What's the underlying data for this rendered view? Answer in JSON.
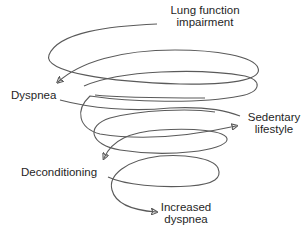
{
  "diagram": {
    "type": "downward-spiral",
    "stroke_color": "#5a5a5a",
    "text_color": "#1f1f1f",
    "background": "#ffffff",
    "nodes": [
      {
        "id": "lung",
        "line1": "Lung function",
        "line2": "impairment"
      },
      {
        "id": "dyspnea",
        "line1": "Dyspnea"
      },
      {
        "id": "sedentary",
        "line1": "Sedentary",
        "line2": "lifestyle"
      },
      {
        "id": "deconditioning",
        "line1": "Deconditioning"
      },
      {
        "id": "increased",
        "line1": "Increased",
        "line2": "dyspnea"
      }
    ],
    "flow": [
      "Lung function impairment",
      "Dyspnea",
      "Sedentary lifestyle",
      "Deconditioning",
      "Increased dyspnea"
    ]
  }
}
